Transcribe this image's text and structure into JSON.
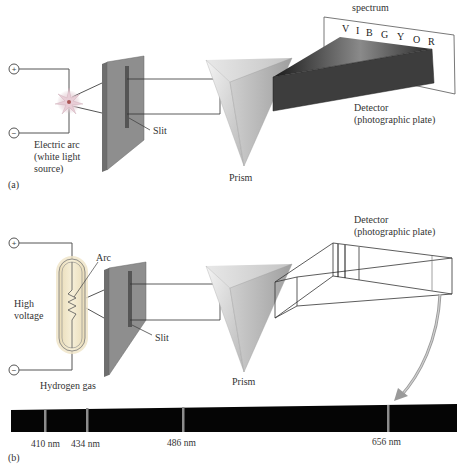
{
  "panel_a": {
    "tag": "(a)",
    "terminal_plus": "+",
    "terminal_minus": "−",
    "source_label_1": "Electric arc",
    "source_label_2": "(white light",
    "source_label_3": "source)",
    "slit_label": "Slit",
    "prism_label": "Prism",
    "spectrum_title": "spectrum",
    "spectrum_letters": [
      "V",
      "I",
      "B",
      "G",
      "Y",
      "O",
      "R"
    ],
    "detector_label_1": "Detector",
    "detector_label_2": "(photographic plate)"
  },
  "panel_b": {
    "tag": "(b)",
    "terminal_plus": "+",
    "terminal_minus": "−",
    "arc_label": "Arc",
    "voltage_label_1": "High",
    "voltage_label_2": "voltage",
    "gas_label": "Hydrogen gas",
    "slit_label": "Slit",
    "prism_label": "Prism",
    "detector_label_1": "Detector",
    "detector_label_2": "(photographic plate)",
    "emission_lines": [
      {
        "label": "410 nm",
        "x": 45
      },
      {
        "label": "434 nm",
        "x": 86
      },
      {
        "label": "486 nm",
        "x": 183
      },
      {
        "label": "656 nm",
        "x": 388
      }
    ]
  },
  "colors": {
    "plate": "#8a8a8a",
    "line": "#3a3a3a",
    "spectrum_bar": "#050505",
    "emission_line": "#8c8c8c",
    "arrow": "#9a9a9a",
    "tube_glow": "#f2e6c4"
  }
}
